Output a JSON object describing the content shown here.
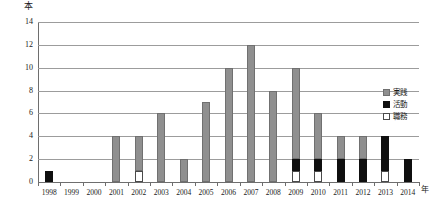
{
  "chart_data": {
    "type": "bar",
    "subtype": "stacked-vertical",
    "title": "",
    "xlabel": "年",
    "ylabel": "本",
    "ylim": [
      0,
      14
    ],
    "ytick_step": 2,
    "yticks": [
      "0",
      "2",
      "4",
      "6",
      "8",
      "10",
      "12",
      "14"
    ],
    "grid": true,
    "legend_position": "right",
    "categories": [
      "1998",
      "1999",
      "2000",
      "2001",
      "2002",
      "2003",
      "2004",
      "2005",
      "2006",
      "2007",
      "2008",
      "2009",
      "2010",
      "2011",
      "2012",
      "2013",
      "2014"
    ],
    "series": [
      {
        "name": "実践",
        "color": "#8f8f8f",
        "values": [
          0,
          0,
          0,
          4,
          3,
          6,
          2,
          7,
          10,
          12,
          8,
          8,
          4,
          2,
          2,
          0,
          0
        ]
      },
      {
        "name": "活動",
        "color": "#0f0f0f",
        "values": [
          1,
          0,
          0,
          0,
          0,
          0,
          0,
          0,
          0,
          0,
          0,
          1,
          1,
          2,
          2,
          3,
          2
        ]
      },
      {
        "name": "職務",
        "color": "#ffffff",
        "values": [
          0,
          0,
          0,
          0,
          1,
          0,
          0,
          0,
          0,
          0,
          0,
          1,
          1,
          0,
          0,
          1,
          0
        ]
      }
    ],
    "totals": [
      1,
      0,
      0,
      4,
      4,
      6,
      2,
      7,
      10,
      12,
      8,
      10,
      6,
      4,
      4,
      4,
      2
    ]
  },
  "legend": {
    "items": [
      {
        "label": "実践",
        "swatch": "gray-swatch"
      },
      {
        "label": "活動",
        "swatch": "black-swatch"
      },
      {
        "label": "職務",
        "swatch": "white-swatch"
      }
    ]
  }
}
